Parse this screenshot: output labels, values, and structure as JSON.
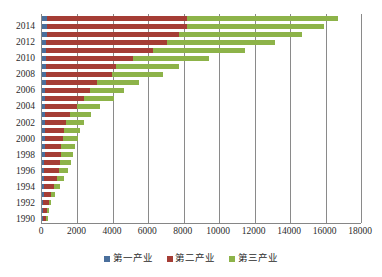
{
  "chart_data": {
    "type": "bar",
    "orientation": "horizontal",
    "stacked": true,
    "title": "",
    "subtitle": "",
    "xlabel": "",
    "ylabel": "",
    "xlim": [
      0,
      18000
    ],
    "ylim": null,
    "grid": true,
    "grid_axis": "x",
    "legend_position": "bottom",
    "xticks": [
      "0",
      "2000",
      "4000",
      "6000",
      "8000",
      "10000",
      "12000",
      "14000",
      "16000",
      "18000"
    ],
    "xtick_values": [
      0,
      2000,
      4000,
      6000,
      8000,
      10000,
      12000,
      14000,
      16000,
      18000
    ],
    "categories": [
      "1990",
      "1991",
      "1992",
      "1993",
      "1994",
      "1995",
      "1996",
      "1997",
      "1998",
      "1999",
      "2000",
      "2001",
      "2002",
      "2003",
      "2004",
      "2005",
      "2006",
      "2007",
      "2008",
      "2009",
      "2010",
      "2011",
      "2012",
      "2013",
      "2014",
      "2015"
    ],
    "ytick_labels_shown": [
      "1990",
      "1992",
      "1994",
      "1996",
      "1998",
      "2000",
      "2002",
      "2004",
      "2006",
      "2008",
      "2010",
      "2012",
      "2014"
    ],
    "series": [
      {
        "name": "第一产业",
        "color": "#4a6f9c",
        "values": [
          60,
          70,
          75,
          85,
          100,
          120,
          135,
          140,
          145,
          150,
          155,
          160,
          165,
          170,
          180,
          190,
          195,
          205,
          215,
          220,
          230,
          240,
          250,
          260,
          265,
          270
        ]
      },
      {
        "name": "第二产业",
        "color": "#a53d35",
        "values": [
          190,
          230,
          300,
          420,
          560,
          700,
          810,
          880,
          900,
          950,
          1020,
          1100,
          1180,
          1420,
          1800,
          2200,
          2520,
          2920,
          3760,
          3970,
          4930,
          6000,
          6830,
          7450,
          7930,
          7920
        ]
      },
      {
        "name": "第三产业",
        "color": "#8db349",
        "values": [
          80,
          100,
          150,
          230,
          330,
          440,
          540,
          620,
          680,
          740,
          830,
          900,
          1000,
          1180,
          1290,
          1700,
          1900,
          2330,
          2880,
          3520,
          4250,
          5200,
          6070,
          6940,
          7720,
          8530
        ]
      }
    ],
    "totals": [
      330,
      400,
      525,
      735,
      990,
      1260,
      1485,
      1640,
      1725,
      1840,
      2005,
      2160,
      2345,
      2770,
      3270,
      4090,
      4615,
      5455,
      6855,
      7710,
      9410,
      11440,
      13150,
      14650,
      15915,
      16720
    ]
  },
  "legend": {
    "items": [
      {
        "label": "第一产业",
        "color": "#4a6f9c",
        "swatch_name": "legend-swatch-primary"
      },
      {
        "label": "第二产业",
        "color": "#a53d35",
        "swatch_name": "legend-swatch-secondary"
      },
      {
        "label": "第三产业",
        "color": "#8db349",
        "swatch_name": "legend-swatch-tertiary"
      }
    ]
  },
  "axis": {
    "axis_color": "#868686",
    "grid_color": "#8a8a8a",
    "text_color": "#2b2b2b"
  }
}
